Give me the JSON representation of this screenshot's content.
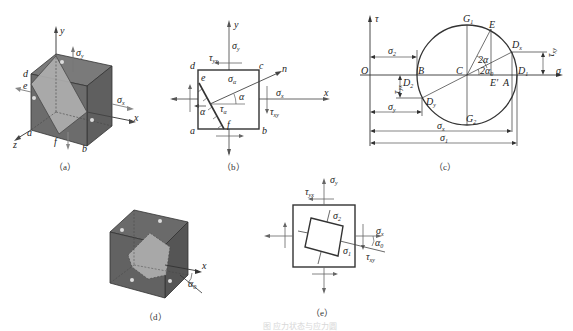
{
  "figure": {
    "caption_faint": "图  应力状态与应力圆",
    "panels": [
      {
        "id": "a",
        "caption": "（a）"
      },
      {
        "id": "b",
        "caption": "（b）"
      },
      {
        "id": "c",
        "caption": "（c）"
      },
      {
        "id": "d",
        "caption": "（d）"
      },
      {
        "id": "e",
        "caption": "（e）"
      }
    ]
  },
  "panel_a": {
    "axes": {
      "x": "x",
      "y": "y",
      "z": "z"
    },
    "points": {
      "a": "a",
      "b": "b",
      "d": "d",
      "e": "e",
      "f": "f"
    },
    "stresses": {
      "sigma_y": "σ",
      "sigma_y_sub": "y",
      "sigma_x": "σ",
      "sigma_x_sub": "x"
    }
  },
  "panel_b": {
    "axes": {
      "x": "x",
      "y": "y",
      "n": "n"
    },
    "points": {
      "a": "a",
      "b": "b",
      "c": "c",
      "d": "d",
      "e": "e",
      "f": "f"
    },
    "labels": {
      "sigma_y": "σ",
      "sigma_y_sub": "y",
      "tau_yx": "τ",
      "tau_yx_sub": "yx",
      "sigma_alpha": "σ",
      "sigma_alpha_sub": "α",
      "sigma_x": "σ",
      "sigma_x_sub": "x",
      "tau_xy": "τ",
      "tau_xy_sub": "xy",
      "tau_alpha": "τ",
      "tau_alpha_sub": "α",
      "alpha_1": "α",
      "alpha_2": "α"
    }
  },
  "panel_c": {
    "axes": {
      "tau": "τ",
      "sigma": "σ"
    },
    "points": {
      "O": "O",
      "B": "B",
      "C": "C",
      "A": "A",
      "E": "E",
      "E_prime": "E′",
      "G1": "G",
      "G1_sub": "1",
      "G2": "G",
      "G2_sub": "2",
      "D1": "D",
      "D1_sub": "1",
      "D2": "D",
      "D2_sub": "2",
      "Dx": "D",
      "Dx_sub": "x",
      "Dy": "D",
      "Dy_sub": "y"
    },
    "angles": {
      "two_alpha": "2α",
      "two_alpha0": "2α",
      "two_alpha0_sub": "0"
    },
    "dimensions": {
      "sigma2": "σ",
      "sigma2_sub": "2",
      "sigma_y": "σ",
      "sigma_y_sub": "y",
      "sigma_x": "σ",
      "sigma_x_sub": "x",
      "sigma1": "σ",
      "sigma1_sub": "1",
      "tau_xy": "τ",
      "tau_xy_sub": "xy",
      "tau_yx": "τ",
      "tau_yx_sub": "yx"
    }
  },
  "panel_d": {
    "axes": {
      "x": "x"
    },
    "angle": {
      "alpha0": "α",
      "alpha0_sub": "0"
    },
    "face_labels": [
      "σ₁",
      "σ₂",
      "σ₃",
      "σ₁",
      "σ₂"
    ]
  },
  "panel_e": {
    "labels": {
      "sigma_y": "σ",
      "sigma_y_sub": "y",
      "tau_yx": "τ",
      "tau_yx_sub": "yx",
      "sigma2": "σ",
      "sigma2_sub": "2",
      "sigma1": "σ",
      "sigma1_sub": "1",
      "sigma_x": "σ",
      "sigma_x_sub": "x",
      "alpha0": "α",
      "alpha0_sub": "0",
      "tau_xy": "τ",
      "tau_xy_sub": "xy"
    }
  },
  "colors": {
    "line": "#333333",
    "cube_dark": "#6e6e6e",
    "cube_mid": "#8a8a8a",
    "plane_light": "#b4b4b4",
    "arrow": "#555555"
  }
}
